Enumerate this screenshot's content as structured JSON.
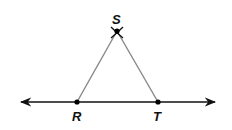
{
  "diagram": {
    "type": "geometric-construction",
    "points": {
      "S": {
        "label": "S",
        "x": 117,
        "y": 31
      },
      "R": {
        "label": "R",
        "x": 77,
        "y": 102
      },
      "T": {
        "label": "T",
        "x": 158,
        "y": 102
      }
    },
    "line": {
      "x1": 20,
      "x2": 216,
      "y": 102,
      "arrows": "both"
    },
    "segments": [
      [
        "R",
        "S"
      ],
      [
        "S",
        "T"
      ]
    ],
    "colors": {
      "line": "#111111",
      "segment": "#888888",
      "point": "#000000"
    }
  }
}
